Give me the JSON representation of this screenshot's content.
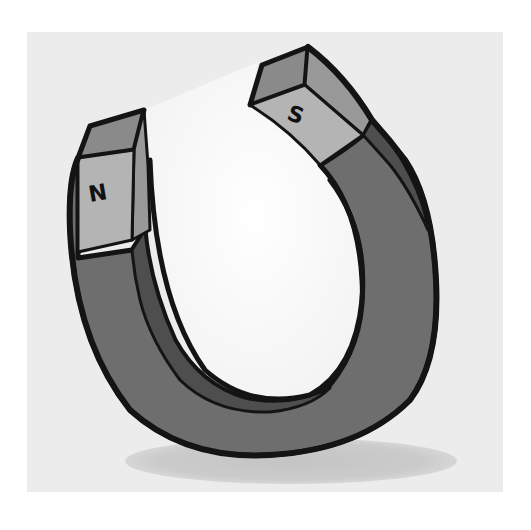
{
  "illustration": {
    "subject": "horseshoe magnet",
    "north_pole": {
      "label": "N"
    },
    "south_pole": {
      "label": "S"
    }
  },
  "colors": {
    "page_background": "#ffffff",
    "panel_background": "#ececec",
    "shadow": "#c9c9c9",
    "body": "#6e6e6e",
    "body_inner_side": "#4e4e4e",
    "pole_face": "#b4b4b4",
    "pole_top": "#8a8a8a",
    "pole_side": "#999999",
    "outline": "#141414",
    "hole": "#fbfbfb"
  }
}
